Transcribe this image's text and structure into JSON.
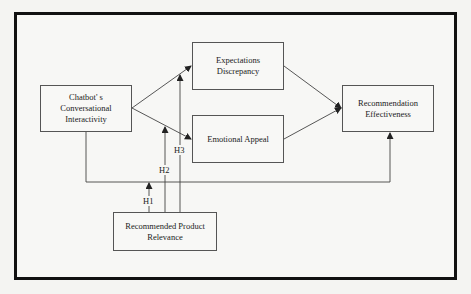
{
  "diagram": {
    "nodes": {
      "chatbot": {
        "line1": "Chatbot' s",
        "line2": "Conversational",
        "line3": "Interactivity"
      },
      "expectations": {
        "line1": "Expectations",
        "line2": "Discrepancy"
      },
      "emotional": {
        "line1": "Emotional Appeal"
      },
      "recommendation": {
        "line1": "Recommendation",
        "line2": "Effectiveness"
      },
      "relevance": {
        "line1": "Recommended Product",
        "line2": "Relevance"
      }
    },
    "hypotheses": {
      "h1": "H1",
      "h2": "H2",
      "h3": "H3"
    },
    "edges": [
      {
        "from": "chatbot",
        "to": "expectations"
      },
      {
        "from": "chatbot",
        "to": "emotional"
      },
      {
        "from": "expectations",
        "to": "recommendation"
      },
      {
        "from": "emotional",
        "to": "recommendation"
      },
      {
        "from": "chatbot",
        "to": "recommendation",
        "route": "below"
      },
      {
        "from": "relevance",
        "to": "chatbot-recommendation-path",
        "label": "H1"
      },
      {
        "from": "relevance",
        "to": "chatbot-emotional-path",
        "label": "H2"
      },
      {
        "from": "relevance",
        "to": "chatbot-expectations-path",
        "label": "H3"
      }
    ]
  }
}
